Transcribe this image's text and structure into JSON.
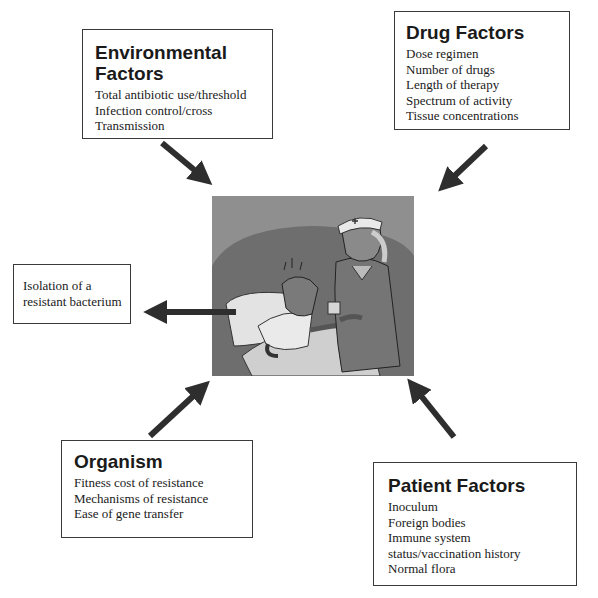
{
  "boxes": {
    "environmental": {
      "title_line1": "Environmental",
      "title_line2": "Factors",
      "items": [
        "Total antibiotic use/threshold",
        "Infection control/cross",
        "Transmission"
      ]
    },
    "drug": {
      "title": "Drug Factors",
      "items": [
        "Dose regimen",
        "Number of drugs",
        "Length of therapy",
        "Spectrum of activity",
        "Tissue concentrations"
      ]
    },
    "isolation": {
      "line1": "Isolation of a",
      "line2": "resistant bacterium"
    },
    "organism": {
      "title": "Organism",
      "items": [
        "Fitness cost of resistance",
        "Mechanisms of resistance",
        "Ease of gene transfer"
      ]
    },
    "patient": {
      "title": "Patient Factors",
      "items": [
        "Inoculum",
        "Foreign bodies",
        "Immune system",
        "status/vaccination history",
        "Normal flora"
      ]
    }
  },
  "illustration": {
    "subject": "nurse-giving-medicine-to-patient-in-bed"
  },
  "colors": {
    "arrow": "#2e2e2e",
    "border": "#3a3a3a",
    "illustration_bg": "#8c8c8c"
  }
}
